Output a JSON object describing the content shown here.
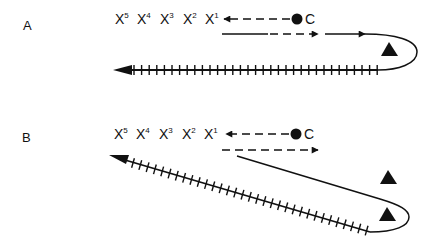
{
  "panels": [
    {
      "label": "A",
      "sites": [
        {
          "base": "X",
          "sup": "5"
        },
        {
          "base": "X",
          "sup": "4"
        },
        {
          "base": "X",
          "sup": "3"
        },
        {
          "base": "X",
          "sup": "2"
        },
        {
          "base": "X",
          "sup": "1"
        }
      ],
      "origin_label": "C",
      "triangle_count": 1
    },
    {
      "label": "B",
      "sites": [
        {
          "base": "X",
          "sup": "5"
        },
        {
          "base": "X",
          "sup": "4"
        },
        {
          "base": "X",
          "sup": "3"
        },
        {
          "base": "X",
          "sup": "2"
        },
        {
          "base": "X",
          "sup": "1"
        }
      ],
      "origin_label": "C",
      "triangle_count": 2
    }
  ],
  "colors": {
    "ink": "#111111",
    "background": "#ffffff"
  }
}
